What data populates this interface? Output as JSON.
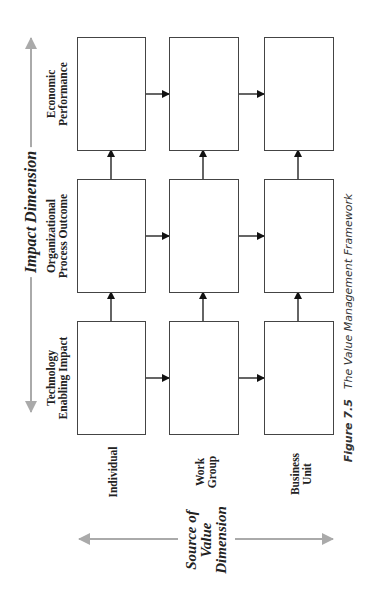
{
  "figure": {
    "number": "Figure 7.5",
    "title": "The Value Management Framework"
  },
  "axes": {
    "impact": {
      "label": "Impact Dimension",
      "color": "#aaaaaa"
    },
    "source": {
      "label_lines": [
        "Source of",
        "Value",
        "Dimension"
      ],
      "color": "#aaaaaa"
    }
  },
  "rows": [
    {
      "label_lines": [
        "Economic",
        "Performance"
      ]
    },
    {
      "label_lines": [
        "Organizational",
        "Process Outcome"
      ]
    },
    {
      "label_lines": [
        "Technology",
        "Enabling Impact"
      ]
    }
  ],
  "columns": [
    {
      "label_lines": [
        "Individual"
      ]
    },
    {
      "label_lines": [
        "Work",
        "Group"
      ]
    },
    {
      "label_lines": [
        "Business",
        "Unit"
      ]
    }
  ],
  "colors": {
    "box_border": "#444444",
    "arrow": "#111111",
    "axis_arrow": "#aaaaaa",
    "text": "#222222"
  }
}
